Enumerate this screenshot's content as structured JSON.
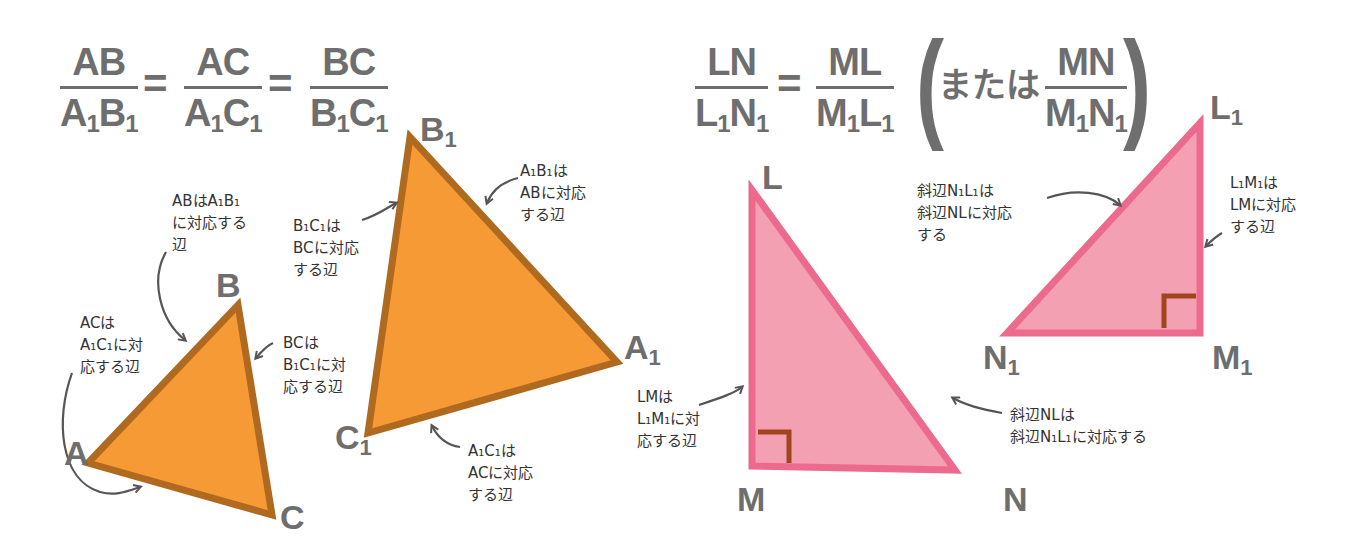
{
  "left": {
    "formula": {
      "f1": {
        "num": "AB",
        "den_a": "A",
        "den_b": "B",
        "sub": "1"
      },
      "f2": {
        "num": "AC",
        "den_a": "A",
        "den_b": "C",
        "sub": "1"
      },
      "f3": {
        "num": "BC",
        "den_a": "B",
        "den_b": "C",
        "sub": "1"
      },
      "eq": "="
    },
    "triangle_small": {
      "fill": "#f59a35",
      "stroke": "#b06a1f",
      "vertices": {
        "A": "A",
        "B": "B",
        "C": "C"
      }
    },
    "triangle_large": {
      "fill": "#f59a35",
      "stroke": "#b06a1f",
      "vertices": {
        "A1": "A",
        "B1": "B",
        "C1": "C",
        "sub": "1"
      }
    },
    "notes": {
      "ab": "ABはA₁B₁\nに対応する\n辺",
      "ac": "ACは\nA₁C₁に対\n応する辺",
      "bc": "BCは\nB₁C₁に対\n応する辺",
      "b1c1": "B₁C₁は\nBCに対応\nする辺",
      "a1b1": "A₁B₁は\nABに対応\nする辺",
      "a1c1": "A₁C₁は\nACに対応\nする辺"
    }
  },
  "right": {
    "formula": {
      "f1": {
        "num": "LN",
        "den_a": "L",
        "den_b": "N",
        "sub": "1"
      },
      "f2": {
        "num": "ML",
        "den_a": "M",
        "den_b": "L",
        "sub": "1"
      },
      "f3": {
        "num": "MN",
        "den_a": "M",
        "den_b": "N",
        "sub": "1"
      },
      "eq": "=",
      "or_word": "または",
      "open_paren": "(",
      "close_paren": ")"
    },
    "triangle_large": {
      "fill": "#f3a0b3",
      "stroke": "#ec6a8e",
      "right_angle_color": "#a0461e",
      "vertices": {
        "L": "L",
        "M": "M",
        "N": "N"
      }
    },
    "triangle_small": {
      "fill": "#f3a0b3",
      "stroke": "#ec6a8e",
      "right_angle_color": "#a0461e",
      "vertices": {
        "L1": "L",
        "M1": "M",
        "N1": "N",
        "sub": "1"
      }
    },
    "notes": {
      "hyp_small": "斜辺N₁L₁は\n斜辺NLに対応\nする",
      "l1m1": "L₁M₁は\nLMに対応\nする辺",
      "lm": "LMは\nL₁M₁に対\n応する辺",
      "hyp_large": "斜辺NLは\n斜辺N₁L₁に対応する"
    }
  }
}
